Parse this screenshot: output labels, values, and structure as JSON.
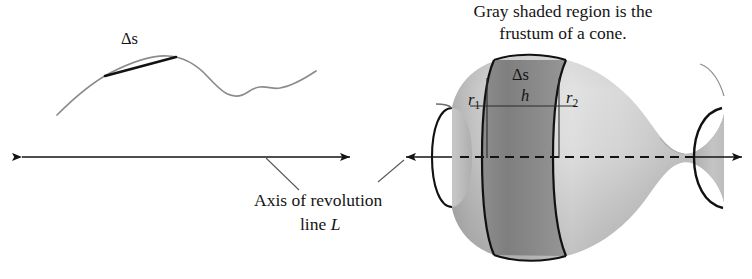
{
  "figure": {
    "title_caption": {
      "line1": "Gray shaded region is the",
      "line2": "frustum of a cone."
    },
    "axis_annotation": {
      "line1": "Axis of revolution",
      "line2_prefix": "line ",
      "line2_symbol": "L"
    },
    "left_panel": {
      "name": "curve-with-secant-chord",
      "arc_length_symbol": "Δs",
      "axis_name": "axis-of-revolution-line"
    },
    "right_panel": {
      "name": "surface-of-revolution",
      "labels": {
        "slant_height": "Δs",
        "height": "h",
        "radius1_base": "r",
        "radius1_sub": "1",
        "radius2_base": "r",
        "radius2_sub": "2"
      }
    },
    "colors": {
      "ink": "#141414",
      "curve_gray": "#8a8a8a",
      "solid_light": "#d2d2d2",
      "solid_mid": "#b4b4b4",
      "solid_dark": "#9a9a9a",
      "frustum_band": "#8e8e8e",
      "background": "#ffffff"
    }
  }
}
